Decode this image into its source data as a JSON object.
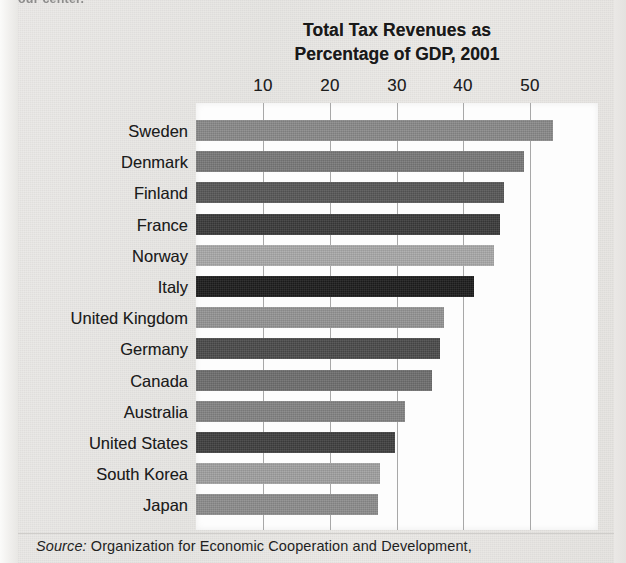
{
  "page": {
    "top_fragment": "our center.",
    "background_color": "#e9e8e6",
    "plot_background_color": "#fdfdfd",
    "gridline_color": "#a8a8a8"
  },
  "source_note": {
    "label": "Source:",
    "text": "Organization for Economic Cooperation and Development,"
  },
  "chart_data": {
    "type": "bar",
    "orientation": "horizontal",
    "title": "Total Tax Revenues as Percentage of GDP, 2001",
    "title_line1": "Total Tax Revenues as",
    "title_line2": "Percentage of GDP, 2001",
    "xlabel": "",
    "ylabel": "",
    "xlim": [
      0,
      60
    ],
    "xticks": [
      10,
      20,
      30,
      40,
      50
    ],
    "xtick_labels": [
      "10",
      "20",
      "30",
      "40",
      "50"
    ],
    "grid": "vertical",
    "axis_position": "top",
    "legend": "none",
    "categories": [
      "Sweden",
      "Denmark",
      "Finland",
      "France",
      "Norway",
      "Italy",
      "United Kingdom",
      "Germany",
      "Canada",
      "Australia",
      "United States",
      "South Korea",
      "Japan"
    ],
    "values": [
      53.4,
      49.1,
      46.1,
      45.5,
      44.6,
      41.6,
      37.1,
      36.5,
      35.3,
      31.3,
      29.8,
      27.5,
      27.2
    ],
    "bar_colors": [
      "#898989",
      "#787878",
      "#575757",
      "#3a3a3a",
      "#a9a9a9",
      "#1c1c1c",
      "#949494",
      "#4a4a4a",
      "#6e6e6e",
      "#838383",
      "#3f3f3f",
      "#a0a0a0",
      "#8c8c8c"
    ]
  }
}
